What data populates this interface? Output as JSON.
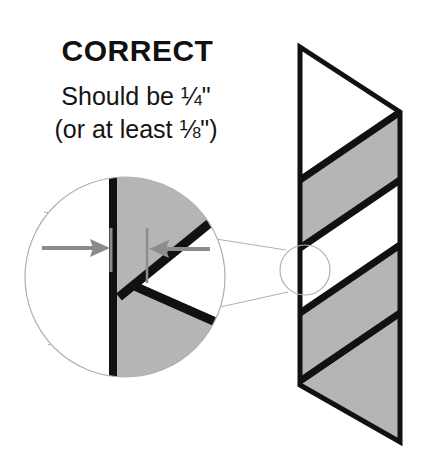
{
  "figure": {
    "title": "CORRECT",
    "caption_line_1": "Should be ¼\"",
    "caption_line_2": "(or at least ⅛\")",
    "background_color": "#ffffff",
    "ink_color": "#111111",
    "panel_fill_color": "#b5b5b5",
    "panel_white_color": "#ffffff",
    "annotation_gray": "#8c8c8c",
    "callout_line_color": "#b0b0b0",
    "measurement": {
      "recommended": "¼\"",
      "minimum": "⅛\"",
      "left_arrow_direction": "right",
      "right_arrow_direction": "left",
      "arrow_color": "#8c8c8c"
    },
    "main_panel": {
      "shape": "parallelogram-strip",
      "left_edge_x": 300,
      "right_edge_x": 400,
      "left_top_y": 47,
      "left_bottom_y": 385,
      "right_top_y": 112,
      "right_bottom_y": 442,
      "band_count": 5,
      "bands": [
        {
          "fill": "white"
        },
        {
          "fill": "gray"
        },
        {
          "fill": "white"
        },
        {
          "fill": "gray"
        },
        {
          "fill": "white"
        }
      ]
    },
    "detail_circle": {
      "center_x": 305,
      "center_y": 270,
      "radius": 25
    },
    "magnifier_circle": {
      "center_x": 125,
      "center_y": 277,
      "radius": 100,
      "edge_line_x": 113,
      "gap_tick_x": 147
    }
  }
}
